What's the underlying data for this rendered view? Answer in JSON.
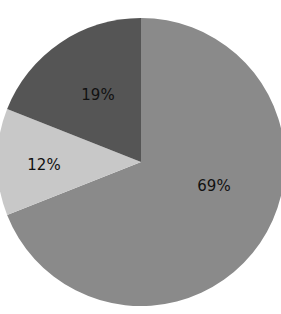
{
  "chart_data": {
    "type": "pie",
    "title": "",
    "categories": [
      "Slice A",
      "Slice B",
      "Slice C"
    ],
    "values": [
      69,
      12,
      19
    ],
    "labels": [
      "69%",
      "12%",
      "19%"
    ],
    "colors": [
      "#8a8a8a",
      "#c8c8c8",
      "#555555"
    ],
    "start_angle": "12 o'clock",
    "direction": "clockwise",
    "legend": "none"
  },
  "slices": [
    {
      "label": "69%",
      "color": "#8a8a8a"
    },
    {
      "label": "12%",
      "color": "#c8c8c8"
    },
    {
      "label": "19%",
      "color": "#555555"
    }
  ]
}
